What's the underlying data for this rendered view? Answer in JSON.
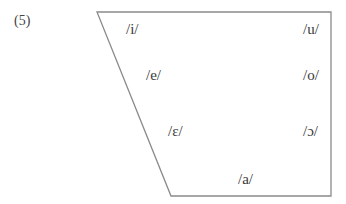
{
  "example_number": "(5)",
  "diagram": {
    "type": "vowel-trapezoid",
    "stroke_color": "#8a8a8a",
    "corners": {
      "top_left": [
        97,
        12
      ],
      "top_right": [
        331,
        12
      ],
      "bottom_right": [
        331,
        196
      ],
      "bottom_left": [
        171,
        196
      ]
    },
    "vowels": [
      {
        "id": "i",
        "label": "/i/",
        "x": 126,
        "y": 22
      },
      {
        "id": "u",
        "label": "/u/",
        "x": 303,
        "y": 22
      },
      {
        "id": "e",
        "label": "/e/",
        "x": 146,
        "y": 68
      },
      {
        "id": "o",
        "label": "/o/",
        "x": 303,
        "y": 68
      },
      {
        "id": "epsilon",
        "label": "/ɛ/",
        "x": 168,
        "y": 124
      },
      {
        "id": "open-o",
        "label": "/ɔ/",
        "x": 303,
        "y": 124
      },
      {
        "id": "a",
        "label": "/a/",
        "x": 238,
        "y": 172
      }
    ]
  }
}
